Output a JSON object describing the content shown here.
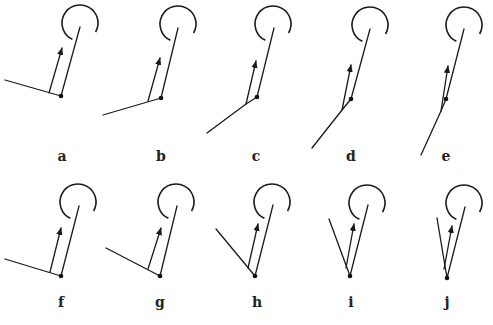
{
  "diagram": {
    "colors": {
      "stroke": "#1a1a1a",
      "background": "#ffffff"
    },
    "panels": [
      {
        "label": "a",
        "dot": [
          61,
          96
        ],
        "top": [
          80,
          27
        ],
        "arc_center": [
          80,
          23
        ],
        "left_end": [
          5,
          80
        ],
        "joint": [
          61,
          96
        ],
        "arrow_from": [
          49,
          93
        ],
        "arrow_to": [
          62,
          48
        ],
        "label_pos": [
          62,
          161
        ]
      },
      {
        "label": "b",
        "dot": [
          161,
          98
        ],
        "top": [
          178,
          28
        ],
        "arc_center": [
          178,
          24
        ],
        "left_end": [
          103,
          115
        ],
        "joint": [
          161,
          98
        ],
        "arrow_from": [
          148,
          101
        ],
        "arrow_to": [
          160,
          58
        ],
        "label_pos": [
          161,
          161
        ]
      },
      {
        "label": "c",
        "dot": [
          257,
          97
        ],
        "top": [
          274,
          28
        ],
        "arc_center": [
          273,
          24
        ],
        "left_end": [
          207,
          133
        ],
        "joint": [
          246,
          104
        ],
        "arrow_from": [
          246,
          104
        ],
        "arrow_to": [
          256,
          61
        ],
        "label_pos": [
          256,
          161
        ]
      },
      {
        "label": "d",
        "dot": [
          351,
          99
        ],
        "top": [
          370,
          29
        ],
        "arc_center": [
          370,
          25
        ],
        "left_end": [
          312,
          148
        ],
        "joint": [
          342,
          110
        ],
        "arrow_from": [
          342,
          110
        ],
        "arrow_to": [
          351,
          65
        ],
        "label_pos": [
          351,
          161
        ]
      },
      {
        "label": "e",
        "dot": [
          446,
          99
        ],
        "top": [
          464,
          29
        ],
        "arc_center": [
          464,
          25
        ],
        "left_end": [
          421,
          155
        ],
        "joint": [
          441,
          111
        ],
        "arrow_from": [
          441,
          111
        ],
        "arrow_to": [
          448,
          66
        ],
        "label_pos": [
          446,
          161
        ]
      },
      {
        "label": "f",
        "dot": [
          61,
          276
        ],
        "top": [
          79,
          206
        ],
        "arc_center": [
          78,
          202
        ],
        "left_end": [
          5,
          259
        ],
        "joint": [
          61,
          276
        ],
        "arrow_from": [
          50,
          272
        ],
        "arrow_to": [
          61,
          228
        ],
        "label_pos": [
          61,
          307
        ]
      },
      {
        "label": "g",
        "dot": [
          160,
          276
        ],
        "top": [
          177,
          206
        ],
        "arc_center": [
          176,
          202
        ],
        "left_end": [
          106,
          248
        ],
        "joint": [
          160,
          276
        ],
        "arrow_from": [
          148,
          269
        ],
        "arrow_to": [
          161,
          228
        ],
        "label_pos": [
          160,
          307
        ]
      },
      {
        "label": "h",
        "dot": [
          255,
          276
        ],
        "top": [
          273,
          205
        ],
        "arc_center": [
          272,
          202
        ],
        "left_end": [
          216,
          229
        ],
        "joint": [
          255,
          276
        ],
        "arrow_from": [
          248,
          268
        ],
        "arrow_to": [
          258,
          224
        ],
        "label_pos": [
          257,
          307
        ]
      },
      {
        "label": "i",
        "dot": [
          350,
          276
        ],
        "top": [
          368,
          205
        ],
        "arc_center": [
          367,
          203
        ],
        "left_end": [
          329,
          219
        ],
        "joint": [
          350,
          276
        ],
        "arrow_from": [
          346,
          268
        ],
        "arrow_to": [
          354,
          224
        ],
        "label_pos": [
          351,
          307
        ]
      },
      {
        "label": "j",
        "dot": [
          447,
          278
        ],
        "top": [
          465,
          207
        ],
        "arc_center": [
          464,
          203
        ],
        "left_end": [
          437,
          218
        ],
        "joint": [
          447,
          278
        ],
        "arrow_from": [
          444,
          269
        ],
        "arrow_to": [
          452,
          226
        ],
        "label_pos": [
          447,
          307
        ]
      }
    ]
  }
}
